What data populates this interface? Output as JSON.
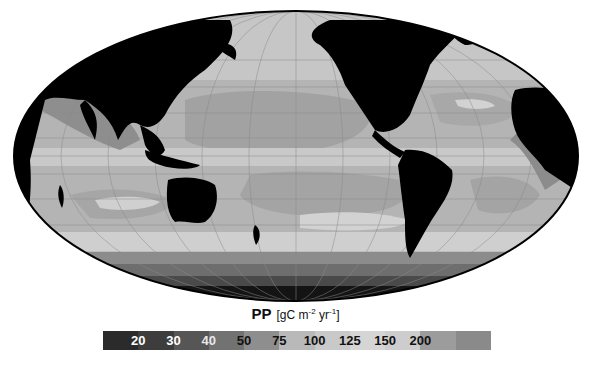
{
  "map": {
    "projection": "Mollweide (global, Pacific-centered)",
    "land_color": "#000000",
    "graticule_color": "#9a9a9a"
  },
  "title": {
    "variable": "PP",
    "unit_open": "[gC m",
    "unit_exp1": "-2",
    "unit_mid": " yr",
    "unit_exp2": "-1",
    "unit_close": "]"
  },
  "legend": {
    "bins": [
      {
        "color": "#2b2b2b"
      },
      {
        "color": "#3d3d3d"
      },
      {
        "color": "#565656"
      },
      {
        "color": "#727272"
      },
      {
        "color": "#8e8e8e"
      },
      {
        "color": "#b9b9b9"
      },
      {
        "color": "#c9c9c9"
      },
      {
        "color": "#d5d5d5"
      },
      {
        "color": "#cdcdcd"
      },
      {
        "color": "#9c9c9c"
      },
      {
        "color": "#8a8a8a"
      }
    ],
    "labels": [
      {
        "text": "20",
        "color": "#ffffff"
      },
      {
        "text": "30",
        "color": "#ffffff"
      },
      {
        "text": "40",
        "color": "#e8e8e8"
      },
      {
        "text": "50",
        "color": "#111111"
      },
      {
        "text": "75",
        "color": "#111111"
      },
      {
        "text": "100",
        "color": "#111111"
      },
      {
        "text": "125",
        "color": "#111111"
      },
      {
        "text": "150",
        "color": "#111111"
      },
      {
        "text": "200",
        "color": "#111111"
      }
    ]
  }
}
